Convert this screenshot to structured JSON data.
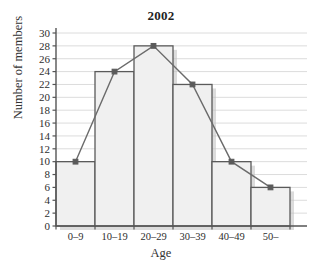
{
  "chart_data": {
    "type": "bar",
    "title": "2002",
    "xlabel": "Age",
    "ylabel": "Number of members",
    "categories": [
      "0–9",
      "10–19",
      "20–29",
      "30–39",
      "40–49",
      "50–"
    ],
    "values": [
      10,
      24,
      28,
      22,
      10,
      6
    ],
    "series": [
      {
        "name": "Number of members (histogram)",
        "values": [
          10,
          24,
          28,
          22,
          10,
          6
        ]
      },
      {
        "name": "Frequency polygon",
        "values": [
          10,
          24,
          28,
          22,
          10,
          6
        ]
      }
    ],
    "ylim": [
      0,
      30
    ],
    "ytick_step": 2,
    "yticks": [
      0,
      2,
      4,
      6,
      8,
      10,
      12,
      14,
      16,
      18,
      20,
      22,
      24,
      26,
      28,
      30
    ],
    "ytick_labels": [
      "0",
      "2",
      "4",
      "6",
      "8",
      "10",
      "12",
      "14",
      "16",
      "18",
      "20",
      "22",
      "24",
      "26",
      "28",
      "30"
    ],
    "grid": true,
    "grid_axis": "y",
    "legend": "none",
    "bar_fill": "#f0f0f0",
    "bar_stroke": "#5a5a5a",
    "line_color": "#6b6b6b",
    "marker_color": "#5a5a5a",
    "grid_color": "#dcdcdc",
    "axis_color": "#555555",
    "background": "#ffffff"
  }
}
